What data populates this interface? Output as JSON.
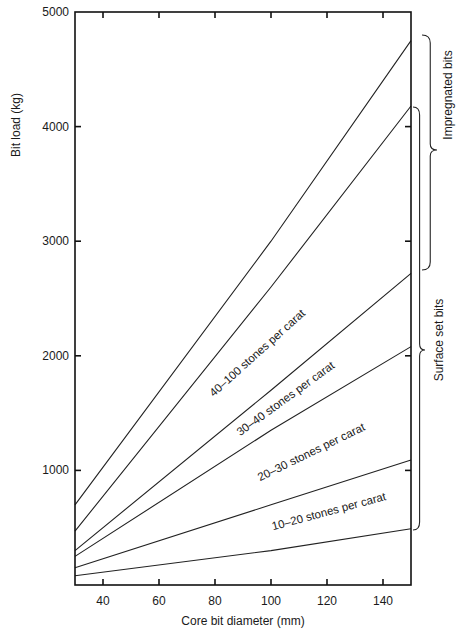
{
  "chart_data": {
    "type": "line",
    "title": "",
    "xlabel": "Core bit diameter (mm)",
    "ylabel": "Bit load (kg)",
    "xlim": [
      30,
      150
    ],
    "ylim": [
      0,
      5000
    ],
    "xticks": [
      40,
      60,
      80,
      100,
      120,
      140
    ],
    "yticks": [
      1000,
      2000,
      3000,
      4000,
      5000
    ],
    "xtick_labels": [
      "40",
      "60",
      "80",
      "100",
      "120",
      "140"
    ],
    "ytick_labels": [
      "1000",
      "2000",
      "3000",
      "4000",
      "5000"
    ],
    "grid": false,
    "legend": "none (inline labels)",
    "x": [
      30,
      100,
      150
    ],
    "series": [
      {
        "name": "Impregnated bits (upper limit)",
        "values": [
          700,
          3000,
          4750
        ]
      },
      {
        "name": "Impregnated bits lower / Surface set upper",
        "values": [
          470,
          2600,
          4180
        ]
      },
      {
        "name": "40–100 stones per carat / 30–40 boundary",
        "values": [
          300,
          1700,
          2720
        ]
      },
      {
        "name": "30–40 / 20–30 stones per carat boundary",
        "values": [
          250,
          1350,
          2080
        ]
      },
      {
        "name": "20–30 / 10–20 stones per carat boundary",
        "values": [
          150,
          700,
          1090
        ]
      },
      {
        "name": "10–20 stones per carat (lower limit)",
        "values": [
          80,
          300,
          490
        ]
      }
    ],
    "annotations": [
      {
        "text": "40–100 stones per carat",
        "x": 96,
        "y": 2000,
        "angle": -42
      },
      {
        "text": "30–40 stones per carat",
        "x": 106,
        "y": 1600,
        "angle": -36
      },
      {
        "text": "20–30 stones per carat",
        "x": 115,
        "y": 1130,
        "angle": -26
      },
      {
        "text": "10–20 stones per carat",
        "x": 121,
        "y": 610,
        "angle": -15
      }
    ],
    "groups": [
      {
        "text": "Impregnated bits",
        "y_range": [
          2700,
          4750
        ]
      },
      {
        "text": "Surface set bits",
        "y_range": [
          490,
          4180
        ]
      }
    ]
  },
  "layout": {
    "plot": {
      "left": 75,
      "right": 411,
      "top": 12,
      "bottom": 585
    },
    "x_label_pos": {
      "x": 243,
      "y": 625
    },
    "y_label_pos": {
      "x": 20,
      "y": 125
    },
    "brace_impregnated": {
      "x": 422,
      "top": 35,
      "bottom": 270,
      "tip": 437,
      "mid": 150
    },
    "brace_surface": {
      "x": 413,
      "top": 107,
      "bottom": 530,
      "tip": 425,
      "mid": 350
    },
    "label_impregnated_pos": {
      "x": 452,
      "y": 95
    },
    "label_surface_pos": {
      "x": 443,
      "y": 340
    }
  }
}
